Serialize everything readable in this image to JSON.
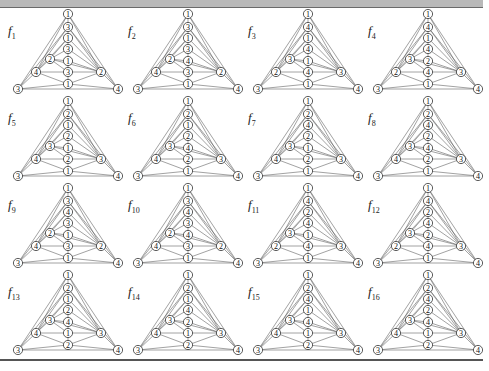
{
  "figure": {
    "node_order_note": "top, column[0..5] top-to-bottom, left_inner, left_mid, right_mid, bottom_left, bottom_right",
    "panels": [
      {
        "name": "f",
        "sub": "1",
        "top": "1",
        "column": [
          "3",
          "1",
          "3",
          "1",
          "3",
          "1"
        ],
        "left_inner": "2",
        "left_mid": "4",
        "right_mid": "2",
        "bottom_left": "3",
        "bottom_right": "4"
      },
      {
        "name": "f",
        "sub": "2",
        "top": "1",
        "column": [
          "3",
          "1",
          "3",
          "4",
          "3",
          "1"
        ],
        "left_inner": "2",
        "left_mid": "4",
        "right_mid": "2",
        "bottom_left": "3",
        "bottom_right": "4"
      },
      {
        "name": "f",
        "sub": "3",
        "top": "1",
        "column": [
          "4",
          "1",
          "4",
          "1",
          "4",
          "1"
        ],
        "left_inner": "3",
        "left_mid": "2",
        "right_mid": "3",
        "bottom_left": "3",
        "bottom_right": "4"
      },
      {
        "name": "f",
        "sub": "4",
        "top": "1",
        "column": [
          "4",
          "1",
          "4",
          "2",
          "4",
          "1"
        ],
        "left_inner": "3",
        "left_mid": "2",
        "right_mid": "3",
        "bottom_left": "3",
        "bottom_right": "4"
      },
      {
        "name": "f",
        "sub": "5",
        "top": "1",
        "column": [
          "2",
          "1",
          "2",
          "1",
          "2",
          "1"
        ],
        "left_inner": "3",
        "left_mid": "4",
        "right_mid": "3",
        "bottom_left": "3",
        "bottom_right": "4"
      },
      {
        "name": "f",
        "sub": "6",
        "top": "1",
        "column": [
          "2",
          "1",
          "2",
          "4",
          "2",
          "1"
        ],
        "left_inner": "3",
        "left_mid": "4",
        "right_mid": "3",
        "bottom_left": "3",
        "bottom_right": "4"
      },
      {
        "name": "f",
        "sub": "7",
        "top": "1",
        "column": [
          "2",
          "4",
          "2",
          "1",
          "2",
          "1"
        ],
        "left_inner": "3",
        "left_mid": "4",
        "right_mid": "3",
        "bottom_left": "3",
        "bottom_right": "4"
      },
      {
        "name": "f",
        "sub": "8",
        "top": "1",
        "column": [
          "2",
          "4",
          "2",
          "4",
          "2",
          "1"
        ],
        "left_inner": "3",
        "left_mid": "4",
        "right_mid": "3",
        "bottom_left": "3",
        "bottom_right": "4"
      },
      {
        "name": "f",
        "sub": "9",
        "top": "1",
        "column": [
          "3",
          "4",
          "3",
          "1",
          "3",
          "1"
        ],
        "left_inner": "2",
        "left_mid": "4",
        "right_mid": "2",
        "bottom_left": "3",
        "bottom_right": "4"
      },
      {
        "name": "f",
        "sub": "10",
        "top": "1",
        "column": [
          "3",
          "4",
          "3",
          "4",
          "3",
          "1"
        ],
        "left_inner": "2",
        "left_mid": "4",
        "right_mid": "2",
        "bottom_left": "3",
        "bottom_right": "4"
      },
      {
        "name": "f",
        "sub": "11",
        "top": "1",
        "column": [
          "4",
          "2",
          "4",
          "1",
          "4",
          "1"
        ],
        "left_inner": "3",
        "left_mid": "2",
        "right_mid": "3",
        "bottom_left": "3",
        "bottom_right": "4"
      },
      {
        "name": "f",
        "sub": "12",
        "top": "1",
        "column": [
          "4",
          "2",
          "4",
          "2",
          "4",
          "1"
        ],
        "left_inner": "3",
        "left_mid": "2",
        "right_mid": "3",
        "bottom_left": "3",
        "bottom_right": "4"
      },
      {
        "name": "f",
        "sub": "13",
        "top": "1",
        "column": [
          "2",
          "1",
          "2",
          "4",
          "1",
          "2"
        ],
        "left_inner": "3",
        "left_mid": "4",
        "right_mid": "3",
        "bottom_left": "3",
        "bottom_right": "4"
      },
      {
        "name": "f",
        "sub": "14",
        "top": "1",
        "column": [
          "2",
          "1",
          "4",
          "2",
          "1",
          "2"
        ],
        "left_inner": "3",
        "left_mid": "4",
        "right_mid": "3",
        "bottom_left": "3",
        "bottom_right": "4"
      },
      {
        "name": "f",
        "sub": "15",
        "top": "1",
        "column": [
          "2",
          "4",
          "1",
          "4",
          "1",
          "2"
        ],
        "left_inner": "3",
        "left_mid": "4",
        "right_mid": "3",
        "bottom_left": "3",
        "bottom_right": "4"
      },
      {
        "name": "f",
        "sub": "16",
        "top": "1",
        "column": [
          "2",
          "4",
          "2",
          "4",
          "1",
          "2"
        ],
        "left_inner": "3",
        "left_mid": "4",
        "right_mid": "3",
        "bottom_left": "3",
        "bottom_right": "4"
      }
    ]
  }
}
